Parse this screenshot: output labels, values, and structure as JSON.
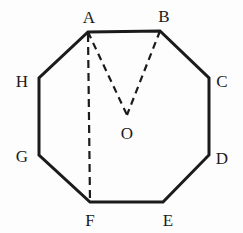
{
  "figure": {
    "shape_name": "octagon",
    "background_color": "#fdfdfd",
    "stroke_color": "#1b1b1b",
    "solid_stroke_width": 3,
    "dashed_stroke_width": 2,
    "dash_pattern": "7,5",
    "vertices": [
      {
        "id": "A",
        "label": "A",
        "x": 88,
        "y": 32,
        "label_x": 89,
        "label_y": 17
      },
      {
        "id": "B",
        "label": "B",
        "x": 160,
        "y": 31,
        "label_x": 164,
        "label_y": 16
      },
      {
        "id": "C",
        "label": "C",
        "x": 209,
        "y": 78,
        "label_x": 222,
        "label_y": 81
      },
      {
        "id": "D",
        "label": "D",
        "x": 209,
        "y": 155,
        "label_x": 222,
        "label_y": 158
      },
      {
        "id": "E",
        "label": "E",
        "x": 163,
        "y": 202,
        "label_x": 168,
        "label_y": 220
      },
      {
        "id": "F",
        "label": "F",
        "x": 90,
        "y": 202,
        "label_x": 90,
        "label_y": 220
      },
      {
        "id": "G",
        "label": "G",
        "x": 39,
        "y": 155,
        "label_x": 22,
        "label_y": 156
      },
      {
        "id": "H",
        "label": "H",
        "x": 39,
        "y": 78,
        "label_x": 22,
        "label_y": 81
      }
    ],
    "center": {
      "id": "O",
      "label": "O",
      "x": 127,
      "y": 115,
      "label_x": 127,
      "label_y": 133
    },
    "outline_path": "M 88,32 L 160,31 L 209,78 L 209,155 L 163,202 L 90,202 L 39,155 L 39,78 Z",
    "dashed_segments": [
      {
        "name": "segment-A-O",
        "from": "A",
        "to": "O",
        "x1": 88,
        "y1": 32,
        "x2": 127,
        "y2": 115
      },
      {
        "name": "segment-B-O",
        "from": "B",
        "to": "O",
        "x1": 160,
        "y1": 31,
        "x2": 127,
        "y2": 115
      },
      {
        "name": "segment-A-F",
        "from": "A",
        "to": "F",
        "x1": 88,
        "y1": 34,
        "x2": 90,
        "y2": 202
      }
    ]
  }
}
